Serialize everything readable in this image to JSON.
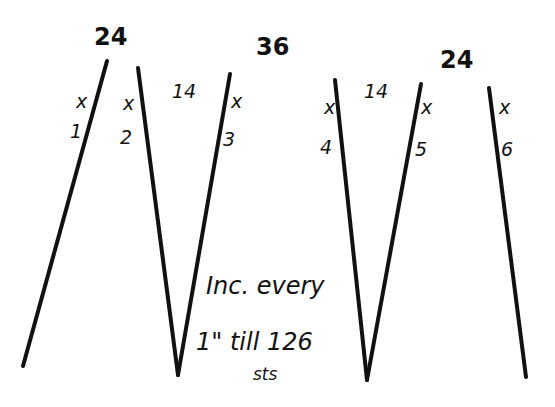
{
  "diagram": {
    "type": "knitting-schematic",
    "width_labels": [
      {
        "id": "top-1",
        "text": "24"
      },
      {
        "id": "top-2",
        "text": "36"
      },
      {
        "id": "top-3",
        "text": "24"
      }
    ],
    "gap_labels": [
      {
        "id": "gap-1",
        "text": "14"
      },
      {
        "id": "gap-2",
        "text": "14"
      }
    ],
    "markers": [
      {
        "id": "m1",
        "symbol": "x",
        "number": "1"
      },
      {
        "id": "m2",
        "symbol": "x",
        "number": "2"
      },
      {
        "id": "m3",
        "symbol": "x",
        "number": "3"
      },
      {
        "id": "m4",
        "symbol": "x",
        "number": "4"
      },
      {
        "id": "m5",
        "symbol": "x",
        "number": "5"
      },
      {
        "id": "m6",
        "symbol": "x",
        "number": "6"
      }
    ],
    "instruction": {
      "line1": "Inc. every",
      "line2": "1\" till 126",
      "line3": "sts"
    },
    "lines": [
      {
        "id": "line-1",
        "x1": 107,
        "y1": 61,
        "x2": 23,
        "y2": 366
      },
      {
        "id": "line-2",
        "x1": 138,
        "y1": 68,
        "x2": 178,
        "y2": 375
      },
      {
        "id": "line-3",
        "x1": 230,
        "y1": 74,
        "x2": 178,
        "y2": 375
      },
      {
        "id": "line-4",
        "x1": 335,
        "y1": 80,
        "x2": 367,
        "y2": 380
      },
      {
        "id": "line-5",
        "x1": 421,
        "y1": 84,
        "x2": 367,
        "y2": 380
      },
      {
        "id": "line-6",
        "x1": 489,
        "y1": 88,
        "x2": 526,
        "y2": 377
      }
    ]
  }
}
